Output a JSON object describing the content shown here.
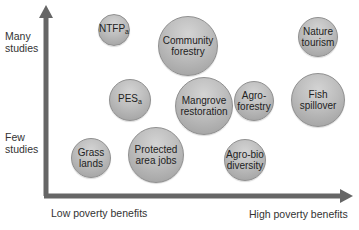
{
  "axes": {
    "y_top_label": "Many\nstudies",
    "y_bottom_label": "Few\nstudies",
    "x_left_label": "Low poverty benefits",
    "x_right_label": "High poverty benefits",
    "axis_color": "#666666"
  },
  "bubbles": [
    {
      "id": "ntfp",
      "label": "NTFP",
      "sub": "a",
      "cx": 114,
      "cy": 30,
      "r": 16
    },
    {
      "id": "community-forestry",
      "label": "Community\nforestry",
      "sub": "",
      "cx": 188,
      "cy": 46,
      "r": 30
    },
    {
      "id": "nature-tourism",
      "label": "Nature\ntourism",
      "sub": "",
      "cx": 318,
      "cy": 37,
      "r": 20
    },
    {
      "id": "pes",
      "label": "PES",
      "sub": "a",
      "cx": 130,
      "cy": 100,
      "r": 21
    },
    {
      "id": "mangrove-restoration",
      "label": "Mangrove\nrestoration",
      "sub": "",
      "cx": 204,
      "cy": 106,
      "r": 29
    },
    {
      "id": "agro-forestry",
      "label": "Agro-\nforestry",
      "sub": "",
      "cx": 254,
      "cy": 101,
      "r": 20
    },
    {
      "id": "fish-spillover",
      "label": "Fish\nspillover",
      "sub": "",
      "cx": 318,
      "cy": 100,
      "r": 27
    },
    {
      "id": "grass-lands",
      "label": "Grass\nlands",
      "sub": "",
      "cx": 91,
      "cy": 158,
      "r": 20
    },
    {
      "id": "protected-area-jobs",
      "label": "Protected\narea jobs",
      "sub": "",
      "cx": 156,
      "cy": 155,
      "r": 28
    },
    {
      "id": "agro-bio-diversity",
      "label": "Agro-bio\ndiversity",
      "sub": "",
      "cx": 245,
      "cy": 160,
      "r": 21
    }
  ],
  "colors": {
    "bubble_fill": "#bdbdbd",
    "bubble_border": "#8f8f8f",
    "axis": "#666666",
    "text": "#222222"
  }
}
